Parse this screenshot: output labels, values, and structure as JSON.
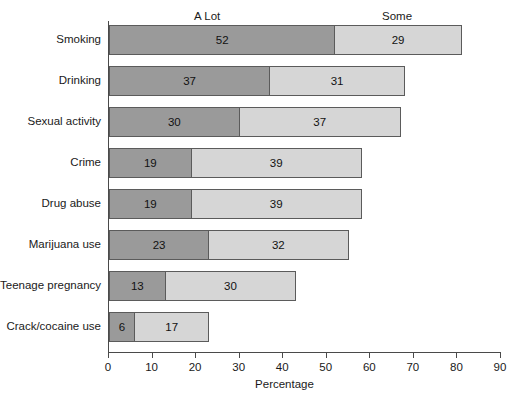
{
  "chart_data": {
    "type": "bar",
    "orientation": "horizontal",
    "stacked": true,
    "title": "",
    "xlabel": "Percentage",
    "ylabel": "",
    "xlim": [
      0,
      90
    ],
    "xticks": [
      0,
      10,
      20,
      30,
      40,
      50,
      60,
      70,
      80,
      90
    ],
    "grid": false,
    "legend_position": "top",
    "categories": [
      "Smoking",
      "Drinking",
      "Sexual activity",
      "Crime",
      "Drug abuse",
      "Marijuana use",
      "Teenage pregnancy",
      "Crack/cocaine use"
    ],
    "series": [
      {
        "name": "A Lot",
        "color": "#9a9a9a",
        "values": [
          52,
          37,
          30,
          19,
          19,
          23,
          13,
          6
        ]
      },
      {
        "name": "Some",
        "color": "#d6d6d6",
        "values": [
          29,
          31,
          37,
          39,
          39,
          32,
          30,
          17
        ]
      }
    ],
    "totals": [
      81,
      68,
      67,
      58,
      58,
      55,
      43,
      23
    ]
  },
  "headers": {
    "a_lot": "A Lot",
    "some": "Some"
  },
  "axis": {
    "title": "Percentage",
    "tick_labels": [
      "0",
      "10",
      "20",
      "30",
      "40",
      "50",
      "60",
      "70",
      "80",
      "90"
    ]
  },
  "colors": {
    "a_lot_fill": "#9a9a9a",
    "some_fill": "#d6d6d6",
    "outline": "#5b5b5b",
    "axis": "#4a4a4a",
    "background": "#ffffff",
    "text": "#1a1a1a"
  }
}
